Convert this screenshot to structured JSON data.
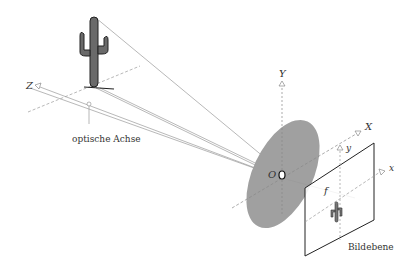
{
  "diagram": {
    "labels": {
      "z_axis": "Z",
      "y_axis": "Y",
      "x_axis": "X",
      "origin": "O",
      "image_x": "x",
      "image_y": "y",
      "focal_length": "f",
      "optical_axis": "optische Achse",
      "image_plane": "Bildebene"
    },
    "objects": {
      "object": "cactus",
      "lens": "lens-ellipse",
      "image": "inverted-cactus"
    },
    "colors": {
      "lens_fill": "#a0a0a0",
      "lines": "#8c8c8c",
      "plane": "#222222",
      "cactus": "#555555"
    }
  }
}
